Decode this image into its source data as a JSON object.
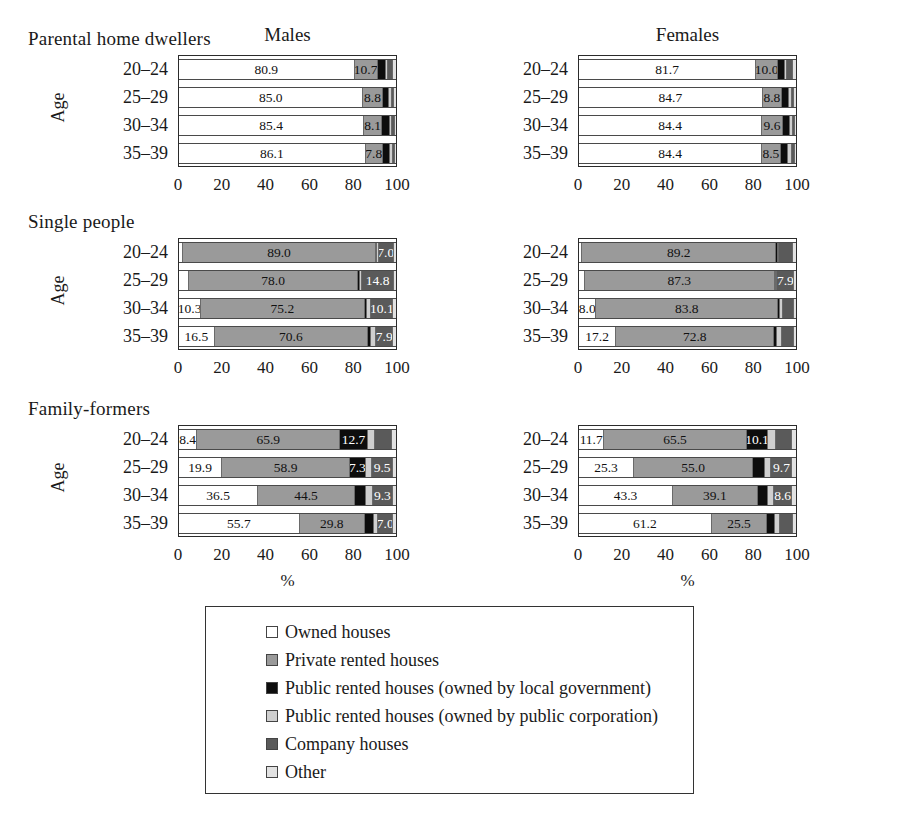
{
  "figure": {
    "axis_title": "Age",
    "x_axis_caption": "%",
    "panel_titles": [
      "Males",
      "Females"
    ],
    "x_ticks": [
      "0",
      "20",
      "40",
      "60",
      "80",
      "100"
    ],
    "categories": [
      "20–24",
      "25–29",
      "30–34",
      "35–39"
    ],
    "group_titles": [
      "Parental home dwellers",
      "Single people",
      "Family-formers"
    ]
  },
  "legend": {
    "items": [
      {
        "label": "Owned houses",
        "color": "#ffffff",
        "key": "owned"
      },
      {
        "label": "Private rented houses",
        "color": "#9a9a9a",
        "key": "private-rented"
      },
      {
        "label": "Public rented houses (owned by local government)",
        "color": "#0d0d0d",
        "key": "public-local-gov"
      },
      {
        "label": "Public rented houses (owned by public corporation)",
        "color": "#cfcfcf",
        "key": "public-corp"
      },
      {
        "label": "Company houses",
        "color": "#5a5a5a",
        "key": "company"
      },
      {
        "label": "Other",
        "color": "#e2e2e2",
        "key": "other"
      }
    ]
  },
  "chart_data": {
    "type": "bar",
    "orientation": "horizontal",
    "stacked": true,
    "title": "",
    "xlabel": "%",
    "ylabel": "Age",
    "xlim": [
      0,
      100
    ],
    "xticks": [
      0,
      20,
      40,
      60,
      80,
      100
    ],
    "grid": false,
    "legend_position": "bottom",
    "categories": [
      "20–24",
      "25–29",
      "30–34",
      "35–39"
    ],
    "series_names": [
      "Owned houses",
      "Private rented houses",
      "Public rented houses (owned by local government)",
      "Public rented houses (owned by public corporation)",
      "Company houses",
      "Other"
    ],
    "panels": [
      {
        "group": "Parental home dwellers",
        "sex": "Males",
        "rows": [
          {
            "category": "20–24",
            "values": [
              80.9,
              10.7,
              3.6,
              1.2,
              2.4,
              1.2
            ],
            "labels": [
              "80.9",
              "10.7",
              "",
              "",
              "",
              ""
            ]
          },
          {
            "category": "25–29",
            "values": [
              85.0,
              8.8,
              3.2,
              1.3,
              1.0,
              0.7
            ],
            "labels": [
              "85.0",
              "8.8",
              "",
              "",
              "",
              ""
            ]
          },
          {
            "category": "30–34",
            "values": [
              85.4,
              8.1,
              3.6,
              1.3,
              1.0,
              0.6
            ],
            "labels": [
              "85.4",
              "8.1",
              "",
              "",
              "",
              ""
            ]
          },
          {
            "category": "35–39",
            "values": [
              86.1,
              7.8,
              3.5,
              1.2,
              0.9,
              0.5
            ],
            "labels": [
              "86.1",
              "7.8",
              "",
              "",
              "",
              ""
            ]
          }
        ]
      },
      {
        "group": "Parental home dwellers",
        "sex": "Females",
        "rows": [
          {
            "category": "20–24",
            "values": [
              81.7,
              10.0,
              3.3,
              1.0,
              2.8,
              1.2
            ],
            "labels": [
              "81.7",
              "10.0",
              "",
              "",
              "",
              ""
            ]
          },
          {
            "category": "25–29",
            "values": [
              84.7,
              8.8,
              3.3,
              1.2,
              1.3,
              0.7
            ],
            "labels": [
              "84.7",
              "8.8",
              "",
              "",
              "",
              ""
            ]
          },
          {
            "category": "30–34",
            "values": [
              84.4,
              9.6,
              3.2,
              1.2,
              1.0,
              0.6
            ],
            "labels": [
              "84.4",
              "9.6",
              "",
              "",
              "",
              ""
            ]
          },
          {
            "category": "35–39",
            "values": [
              84.4,
              8.5,
              3.6,
              1.6,
              1.3,
              0.6
            ],
            "labels": [
              "84.4",
              "8.5",
              "",
              "",
              "",
              ""
            ]
          }
        ]
      },
      {
        "group": "Single people",
        "sex": "Males",
        "rows": [
          {
            "category": "20–24",
            "values": [
              1.8,
              89.0,
              0.6,
              0.6,
              7.0,
              1.0
            ],
            "labels": [
              "",
              "89.0",
              "",
              "",
              "7.0",
              ""
            ]
          },
          {
            "category": "25–29",
            "values": [
              4.6,
              78.0,
              1.0,
              0.8,
              14.8,
              0.8
            ],
            "labels": [
              "",
              "78.0",
              "",
              "",
              "14.8",
              ""
            ]
          },
          {
            "category": "30–34",
            "values": [
              10.3,
              75.2,
              1.0,
              2.2,
              10.1,
              1.2
            ],
            "labels": [
              "10.3",
              "75.2",
              "",
              "",
              "10.1",
              ""
            ]
          },
          {
            "category": "35–39",
            "values": [
              16.5,
              70.6,
              1.2,
              2.6,
              7.9,
              1.2
            ],
            "labels": [
              "16.5",
              "70.6",
              "",
              "",
              "7.9",
              ""
            ]
          }
        ]
      },
      {
        "group": "Single people",
        "sex": "Females",
        "rows": [
          {
            "category": "20–24",
            "values": [
              1.6,
              89.2,
              0.7,
              0.7,
              6.6,
              1.2
            ],
            "labels": [
              "",
              "89.2",
              "",
              "",
              "",
              ""
            ]
          },
          {
            "category": "25–29",
            "values": [
              2.8,
              87.3,
              0.8,
              0.4,
              7.9,
              0.8
            ],
            "labels": [
              "",
              "87.3",
              "",
              "",
              "7.9",
              ""
            ]
          },
          {
            "category": "30–34",
            "values": [
              8.0,
              83.8,
              0.9,
              1.4,
              5.0,
              0.9
            ],
            "labels": [
              "8.0",
              "83.8",
              "",
              "",
              "",
              ""
            ]
          },
          {
            "category": "35–39",
            "values": [
              17.2,
              72.8,
              1.3,
              2.4,
              5.3,
              1.0
            ],
            "labels": [
              "17.2",
              "72.8",
              "",
              "",
              "",
              ""
            ]
          }
        ]
      },
      {
        "group": "Family-formers",
        "sex": "Males",
        "rows": [
          {
            "category": "20–24",
            "values": [
              8.4,
              65.9,
              12.7,
              3.2,
              8.0,
              1.8
            ],
            "labels": [
              "8.4",
              "65.9",
              "12.7",
              "",
              "",
              ""
            ]
          },
          {
            "category": "25–29",
            "values": [
              19.9,
              58.9,
              7.3,
              3.0,
              9.5,
              1.4
            ],
            "labels": [
              "19.9",
              "58.9",
              "7.3",
              "",
              "9.5",
              ""
            ]
          },
          {
            "category": "30–34",
            "values": [
              36.5,
              44.5,
              5.3,
              3.0,
              9.3,
              1.4
            ],
            "labels": [
              "36.5",
              "44.5",
              "",
              "",
              "9.3",
              ""
            ]
          },
          {
            "category": "35–39",
            "values": [
              55.7,
              29.8,
              4.5,
              1.8,
              7.0,
              1.2
            ],
            "labels": [
              "55.7",
              "29.8",
              "",
              "",
              "7.0",
              ""
            ]
          }
        ]
      },
      {
        "group": "Family-formers",
        "sex": "Females",
        "rows": [
          {
            "category": "20–24",
            "values": [
              11.7,
              65.5,
              10.1,
              3.3,
              7.6,
              1.8
            ],
            "labels": [
              "11.7",
              "65.5",
              "10.1",
              "",
              "",
              ""
            ]
          },
          {
            "category": "25–29",
            "values": [
              25.3,
              55.0,
              5.4,
              3.0,
              9.7,
              1.6
            ],
            "labels": [
              "25.3",
              "55.0",
              "",
              "",
              "9.7",
              ""
            ]
          },
          {
            "category": "30–34",
            "values": [
              43.3,
              39.1,
              4.6,
              2.8,
              8.6,
              1.6
            ],
            "labels": [
              "43.3",
              "39.1",
              "",
              "",
              "8.6",
              ""
            ]
          },
          {
            "category": "35–39",
            "values": [
              61.2,
              25.5,
              3.6,
              2.5,
              6.0,
              1.2
            ],
            "labels": [
              "61.2",
              "25.5",
              "",
              "",
              "",
              ""
            ]
          }
        ]
      }
    ]
  }
}
